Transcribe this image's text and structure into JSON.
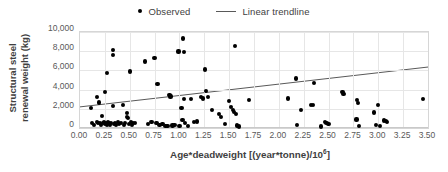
{
  "chart_data": {
    "type": "scatter",
    "title": "",
    "xlabel_prefix": "Age*deadweight [(year*tonne)/10",
    "xlabel_superscript": "6",
    "xlabel_suffix": "]",
    "xlabel": "Age*deadweight [(year*tonne)/10^6]",
    "ylabel_line1": "Structural steel",
    "ylabel_line2": "renewal weight (kg)",
    "ylabel": "Structural steel renewal weight (kg)",
    "xlim": [
      0.0,
      3.5
    ],
    "ylim": [
      0,
      10000
    ],
    "grid": true,
    "legend_position": "top-center",
    "xticks": [
      "0.00",
      "0.25",
      "0.50",
      "0.75",
      "1.00",
      "1.25",
      "1.50",
      "1.75",
      "2.00",
      "2.25",
      "2.50",
      "2.75",
      "3.00",
      "3.25",
      "3.50"
    ],
    "xtick_values": [
      0.0,
      0.25,
      0.5,
      0.75,
      1.0,
      1.25,
      1.5,
      1.75,
      2.0,
      2.25,
      2.5,
      2.75,
      3.0,
      3.25,
      3.5
    ],
    "yticks": [
      "0",
      "2,000",
      "4,000",
      "6,000",
      "8,000",
      "10,000"
    ],
    "ytick_values": [
      0,
      2000,
      4000,
      6000,
      8000,
      10000
    ],
    "series": [
      {
        "name": "Observed",
        "type": "scatter",
        "marker": "circle",
        "color": "#000000",
        "points": [
          [
            0.11,
            2050
          ],
          [
            0.12,
            500
          ],
          [
            0.14,
            330
          ],
          [
            0.17,
            3200
          ],
          [
            0.17,
            620
          ],
          [
            0.18,
            480
          ],
          [
            0.19,
            2650
          ],
          [
            0.2,
            560
          ],
          [
            0.21,
            300
          ],
          [
            0.22,
            1230
          ],
          [
            0.23,
            520
          ],
          [
            0.24,
            640
          ],
          [
            0.25,
            3780
          ],
          [
            0.25,
            420
          ],
          [
            0.26,
            560
          ],
          [
            0.27,
            5700
          ],
          [
            0.27,
            350
          ],
          [
            0.28,
            610
          ],
          [
            0.29,
            480
          ],
          [
            0.3,
            300
          ],
          [
            0.31,
            520
          ],
          [
            0.33,
            8120
          ],
          [
            0.33,
            7620
          ],
          [
            0.33,
            2300
          ],
          [
            0.34,
            420
          ],
          [
            0.35,
            560
          ],
          [
            0.36,
            330
          ],
          [
            0.38,
            620
          ],
          [
            0.39,
            400
          ],
          [
            0.41,
            480
          ],
          [
            0.43,
            2420
          ],
          [
            0.44,
            350
          ],
          [
            0.45,
            560
          ],
          [
            0.47,
            1550
          ],
          [
            0.47,
            1180
          ],
          [
            0.48,
            1020
          ],
          [
            0.49,
            420
          ],
          [
            0.5,
            5880
          ],
          [
            0.51,
            640
          ],
          [
            0.52,
            330
          ],
          [
            0.53,
            480
          ],
          [
            0.55,
            560
          ],
          [
            0.65,
            6920
          ],
          [
            0.68,
            380
          ],
          [
            0.72,
            620
          ],
          [
            0.75,
            7250
          ],
          [
            0.77,
            520
          ],
          [
            0.78,
            4570
          ],
          [
            0.8,
            320
          ],
          [
            0.83,
            440
          ],
          [
            0.86,
            250
          ],
          [
            0.88,
            200
          ],
          [
            0.9,
            3420
          ],
          [
            0.91,
            3280
          ],
          [
            0.93,
            260
          ],
          [
            0.95,
            300
          ],
          [
            0.99,
            7960
          ],
          [
            1.0,
            240
          ],
          [
            1.02,
            2060
          ],
          [
            1.03,
            840
          ],
          [
            1.04,
            9320
          ],
          [
            1.05,
            7950
          ],
          [
            1.05,
            3040
          ],
          [
            1.06,
            560
          ],
          [
            1.09,
            180
          ],
          [
            1.12,
            3020
          ],
          [
            1.15,
            620
          ],
          [
            1.18,
            680
          ],
          [
            1.22,
            3240
          ],
          [
            1.24,
            3080
          ],
          [
            1.26,
            6100
          ],
          [
            1.27,
            3820
          ],
          [
            1.29,
            3260
          ],
          [
            1.33,
            1880
          ],
          [
            1.4,
            1480
          ],
          [
            1.42,
            1150
          ],
          [
            1.46,
            400
          ],
          [
            1.5,
            2850
          ],
          [
            1.52,
            2200
          ],
          [
            1.54,
            1900
          ],
          [
            1.55,
            1650
          ],
          [
            1.56,
            8560
          ],
          [
            1.57,
            1420
          ],
          [
            1.58,
            260
          ],
          [
            1.6,
            160
          ],
          [
            1.7,
            2900
          ],
          [
            2.09,
            3080
          ],
          [
            2.17,
            5150
          ],
          [
            2.18,
            300
          ],
          [
            2.22,
            1880
          ],
          [
            2.32,
            2420
          ],
          [
            2.34,
            2380
          ],
          [
            2.35,
            4660
          ],
          [
            2.42,
            150
          ],
          [
            2.46,
            620
          ],
          [
            2.48,
            540
          ],
          [
            2.5,
            420
          ],
          [
            2.64,
            3780
          ],
          [
            2.65,
            3520
          ],
          [
            2.78,
            880
          ],
          [
            2.79,
            2880
          ],
          [
            2.8,
            2620
          ],
          [
            2.81,
            180
          ],
          [
            2.96,
            1620
          ],
          [
            2.98,
            300
          ],
          [
            3.0,
            2420
          ],
          [
            3.02,
            180
          ],
          [
            3.06,
            780
          ],
          [
            3.08,
            700
          ],
          [
            3.09,
            640
          ],
          [
            3.45,
            3060
          ]
        ]
      },
      {
        "name": "Linear trendline",
        "type": "line",
        "color": "#595959",
        "x_start": 0.0,
        "y_start": 2200,
        "x_end": 3.5,
        "y_end": 6350
      }
    ],
    "legend": [
      {
        "label": "Observed",
        "marker": "dot"
      },
      {
        "label": "Linear trendline",
        "marker": "line"
      }
    ]
  }
}
